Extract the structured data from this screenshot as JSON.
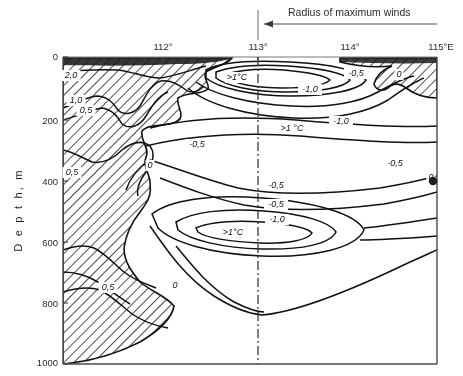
{
  "figure": {
    "title": "",
    "annotation": {
      "text": "Radius of maximum winds",
      "arrow": "left-arrow"
    },
    "axes": {
      "ylabel": "D e p t h,  m",
      "ylabel_plain": "Depth, m",
      "xlabel": "",
      "x_ticks": [
        "112°",
        "113°",
        "114°",
        "115°E"
      ],
      "y_ticks": [
        "0",
        "200",
        "400",
        "600",
        "800",
        "1000"
      ]
    }
  },
  "chart_data": {
    "type": "line",
    "subtype": "contour-cross-section",
    "title": "Radius of maximum winds",
    "xlabel": "Longitude",
    "ylabel": "Depth, m",
    "xlim": [
      111.2,
      115.0
    ],
    "ylim": [
      1000,
      0
    ],
    "y_inverted": true,
    "grid": false,
    "legend": "none",
    "x": [
      111.2,
      112.0,
      113.0,
      114.0,
      115.0
    ],
    "x_tick_values": [
      112,
      113,
      114,
      115
    ],
    "x_tick_labels": [
      "112°",
      "113°",
      "114°",
      "115°E"
    ],
    "y_tick_values": [
      0,
      200,
      400,
      600,
      800,
      1000
    ],
    "y_tick_labels": [
      "0",
      "200",
      "400",
      "600",
      "800",
      "1000"
    ],
    "units": "°C",
    "contour_levels": [
      -1.0,
      -0.5,
      0,
      0.5,
      1.0,
      2.0
    ],
    "contour_labels": [
      {
        "text": "2,0",
        "value": 2.0,
        "x": 71,
        "y": 78
      },
      {
        "text": "1,0",
        "value": 1.0,
        "x": 76,
        "y": 103
      },
      {
        "text": "0,5",
        "value": 0.5,
        "x": 86,
        "y": 113
      },
      {
        "text": "0,5",
        "value": 0.5,
        "x": 72,
        "y": 175
      },
      {
        "text": "0",
        "value": 0.0,
        "x": 150,
        "y": 168
      },
      {
        "text": "0,5",
        "value": 0.5,
        "x": 108,
        "y": 290
      },
      {
        "text": "0",
        "value": 0.0,
        "x": 175,
        "y": 288
      },
      {
        "text": ">1°C",
        "value": 1.0,
        "x": 237,
        "y": 80
      },
      {
        "text": "-1,0",
        "value": -1.0,
        "x": 310,
        "y": 92
      },
      {
        "text": "-0,5",
        "value": -0.5,
        "x": 356,
        "y": 76
      },
      {
        "text": "0",
        "value": 0.0,
        "x": 399,
        "y": 77
      },
      {
        "text": "-1,0",
        "value": -1.0,
        "x": 341,
        "y": 124
      },
      {
        "text": ">1 °C",
        "value": 1.0,
        "x": 292,
        "y": 131
      },
      {
        "text": "-0,5",
        "value": -0.5,
        "x": 197,
        "y": 147
      },
      {
        "text": "-0,5",
        "value": -0.5,
        "x": 276,
        "y": 188
      },
      {
        "text": "-0,5",
        "value": -0.5,
        "x": 276,
        "y": 207
      },
      {
        "text": "-1,0",
        "value": -1.0,
        "x": 277,
        "y": 222
      },
      {
        "text": ">1°C",
        "value": 1.0,
        "x": 233,
        "y": 235
      },
      {
        "text": "-0,5",
        "value": -0.5,
        "x": 395,
        "y": 166
      },
      {
        "text": "0",
        "value": 0.0,
        "x": 431,
        "y": 180
      }
    ],
    "hatched_regions": [
      {
        "name": "shelf-wedge-left",
        "description": "hatched positive-anomaly wedge along western boundary from surface to 1000 m"
      },
      {
        "name": "surface-wedge-right",
        "description": "hatched wedge at surface near 114.5°-115°E"
      }
    ],
    "reference_line": {
      "name": "radius-of-maximum-winds",
      "x": 113.0,
      "style": "dash-dot"
    }
  }
}
